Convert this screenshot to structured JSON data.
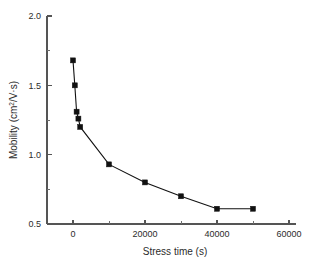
{
  "chart_data": {
    "type": "line",
    "title": "",
    "xlabel": "Stress time (s)",
    "ylabel": "Mobility (cm2/V·s)",
    "ylabel_parts": {
      "prefix": "Mobility (cm",
      "superscript": "2",
      "suffix": "/V·s)"
    },
    "x": [
      0,
      500,
      1000,
      1500,
      2000,
      10000,
      20000,
      30000,
      40000,
      50000
    ],
    "values": [
      1.68,
      1.5,
      1.31,
      1.26,
      1.2,
      0.93,
      0.8,
      0.7,
      0.61,
      0.61
    ],
    "xlim": [
      -10500,
      62000
    ],
    "ylim": [
      0.5,
      2.0
    ],
    "xticks": [
      0,
      20000,
      40000,
      60000
    ],
    "xticklabels": [
      "0",
      "20000",
      "40000",
      "60000"
    ],
    "xminorticks": [
      10000,
      30000,
      50000
    ],
    "yticks": [
      0.5,
      1.0,
      1.5,
      2.0
    ],
    "yticklabels": [
      "0.5",
      "1.0",
      "1.5",
      "2.0"
    ],
    "yminorticks": [
      0.75,
      1.25,
      1.75
    ],
    "grid": false,
    "legend": null,
    "marker": "filled-square",
    "marker_color": "#111111",
    "line_color": "#111111",
    "axis_color": "#555555",
    "background": "#ffffff"
  }
}
